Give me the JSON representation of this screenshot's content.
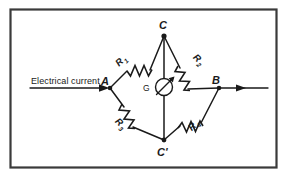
{
  "figure": {
    "frame": {
      "border_color": "#3a3a3a",
      "background": "#ffffff"
    },
    "line_color": "#1a1a1a",
    "caption": {
      "text": "Electrical current"
    },
    "nodes": [
      {
        "id": "node-a",
        "label": "A",
        "x": 110,
        "y": 88,
        "label_x": 103,
        "label_y": 83
      },
      {
        "id": "node-b",
        "label": "B",
        "x": 219,
        "y": 88,
        "label_x": 214,
        "label_y": 82
      },
      {
        "id": "node-c",
        "label": "C",
        "x": 164,
        "y": 36,
        "label_x": 160,
        "label_y": 28
      },
      {
        "id": "node-c-prime",
        "label": "C'",
        "x": 164,
        "y": 140,
        "label_x": 158,
        "label_y": 155
      }
    ],
    "resistors": [
      {
        "id": "resistor-r1",
        "label": "R",
        "subscript": "1",
        "branch": "A-C",
        "label_x": 124,
        "label_y": 59
      },
      {
        "id": "resistor-r2",
        "label": "R",
        "subscript": "2",
        "branch": "C-B",
        "label_x": 195,
        "label_y": 58
      },
      {
        "id": "resistor-r3",
        "label": "R",
        "subscript": "3",
        "branch": "A-C'",
        "label_x": 118,
        "label_y": 127
      },
      {
        "id": "resistor-r4",
        "label": "R",
        "subscript": "4",
        "branch": "C'-B",
        "label_x": 194,
        "label_y": 127
      }
    ],
    "galvanometer": {
      "id": "galvanometer",
      "label": "G",
      "label_x": 146,
      "label_y": 91,
      "cx": 164,
      "cy": 87,
      "r": 8.5
    },
    "arrows": [
      {
        "id": "current-in-arrow",
        "direction": "right",
        "from_x": 30,
        "from_y": 88,
        "to_x": 108,
        "to_y": 88
      },
      {
        "id": "current-out-arrow",
        "direction": "right",
        "from_x": 221,
        "from_y": 88,
        "to_x": 268,
        "to_y": 88
      }
    ]
  }
}
